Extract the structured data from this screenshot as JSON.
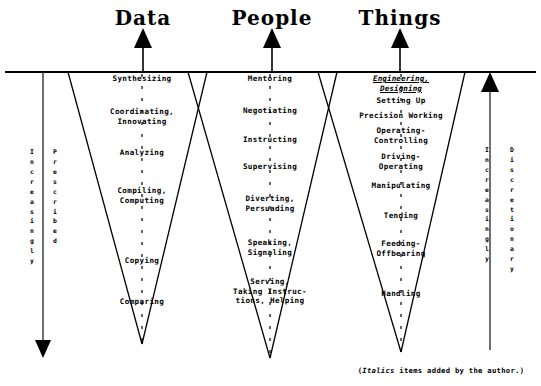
{
  "figure": {
    "title_font_color": "#000000",
    "background": "#ffffff",
    "line_color": "#000000"
  },
  "columns": [
    {
      "id": "data",
      "title": "Data",
      "title_x": 143,
      "title_y": 8,
      "arrow_x": 143,
      "apex_x": 142,
      "apex_y": 344,
      "top_left_x": 68,
      "top_right_x": 207,
      "items": [
        {
          "text": "Synthesizing",
          "y": 74,
          "italic": false
        },
        {
          "text": "Coordinating,\nInnovating",
          "y": 107,
          "italic": false
        },
        {
          "text": "Analyzing",
          "y": 148,
          "italic": false
        },
        {
          "text": "Compiling,\nComputing",
          "y": 186,
          "italic": false
        },
        {
          "text": "Copying",
          "y": 256,
          "italic": false
        },
        {
          "text": "Comparing",
          "y": 297,
          "italic": false
        }
      ]
    },
    {
      "id": "people",
      "title": "People",
      "title_x": 272,
      "title_y": 8,
      "arrow_x": 272,
      "apex_x": 270,
      "apex_y": 358,
      "top_left_x": 188,
      "top_right_x": 337,
      "items": [
        {
          "text": "Mentoring",
          "y": 74,
          "italic": false
        },
        {
          "text": "Negotiating",
          "y": 106,
          "italic": false
        },
        {
          "text": "Instructing",
          "y": 135,
          "italic": false
        },
        {
          "text": "Supervising",
          "y": 162,
          "italic": false
        },
        {
          "text": "Diverting,\nPersuading",
          "y": 194,
          "italic": false
        },
        {
          "text": "Speaking,\nSignaling",
          "y": 238,
          "italic": false
        },
        {
          "text": "Serving,\nTaking Instruc-\ntions, Helping",
          "y": 277,
          "italic": false
        }
      ]
    },
    {
      "id": "things",
      "title": "Things",
      "title_x": 400,
      "title_y": 8,
      "arrow_x": 400,
      "apex_x": 401,
      "apex_y": 352,
      "top_left_x": 318,
      "top_right_x": 465,
      "items": [
        {
          "text": "Engineering,\nDesigning",
          "y": 74,
          "italic": true
        },
        {
          "text": "Setting Up",
          "y": 96,
          "italic": false
        },
        {
          "text": "Precision Working",
          "y": 111,
          "italic": false
        },
        {
          "text": "Operating-\nControlling",
          "y": 126,
          "italic": false
        },
        {
          "text": "Driving-\nOperating",
          "y": 152,
          "italic": false
        },
        {
          "text": "Manipulating",
          "y": 181,
          "italic": false
        },
        {
          "text": "Tending",
          "y": 211,
          "italic": false
        },
        {
          "text": "Feeding-\nOffbearing",
          "y": 239,
          "italic": false
        },
        {
          "text": "Handling",
          "y": 289,
          "italic": false
        }
      ]
    }
  ],
  "side_axes": {
    "left": {
      "word_outer": "Increasingly",
      "word_inner": "Prescribed",
      "outer_x": 32,
      "inner_x": 55,
      "axis_x": 43,
      "axis_top": 72,
      "axis_bottom": 340,
      "direction": "down",
      "text_y": 148
    },
    "right": {
      "word_outer": "Discretionary",
      "word_inner": "Increasingly",
      "outer_x": 512,
      "inner_x": 487,
      "axis_x": 490,
      "axis_top": 72,
      "axis_bottom": 350,
      "direction": "up",
      "text_y": 146
    }
  },
  "footnote": {
    "prefix": "(",
    "italic_word": "Italics",
    "suffix": " items added by the author.)",
    "x": 441,
    "y": 366
  },
  "baseline": {
    "y": 72,
    "x_start": 5,
    "x_end": 536
  }
}
